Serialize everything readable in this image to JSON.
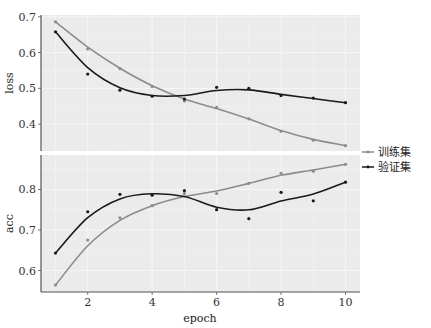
{
  "chart_data": [
    {
      "type": "line",
      "panel": "loss",
      "ylabel": "loss",
      "xlabel": "epoch",
      "x": [
        1,
        2,
        3,
        4,
        5,
        6,
        7,
        8,
        9,
        10
      ],
      "ylim": [
        0.325,
        0.705
      ],
      "yticks": [
        0.4,
        0.5,
        0.6,
        0.7
      ],
      "ytick_labels": [
        "0.4",
        "0.5",
        "0.6",
        "0.7"
      ],
      "series": [
        {
          "name": "训练集",
          "color": "#8c8c8c",
          "values": [
            0.686,
            0.61,
            0.555,
            0.505,
            0.465,
            0.447,
            0.415,
            0.38,
            0.355,
            0.34
          ]
        },
        {
          "name": "验证集",
          "color": "#1a1a1a",
          "values": [
            0.658,
            0.54,
            0.495,
            0.478,
            0.47,
            0.503,
            0.5,
            0.48,
            0.473,
            0.46
          ]
        }
      ],
      "smooth": true,
      "grid": true
    },
    {
      "type": "line",
      "panel": "acc",
      "ylabel": "acc",
      "xlabel": "epoch",
      "x": [
        1,
        2,
        3,
        4,
        5,
        6,
        7,
        8,
        9,
        10
      ],
      "ylim": [
        0.547,
        0.885
      ],
      "yticks": [
        0.6,
        0.7,
        0.8
      ],
      "ytick_labels": [
        "0.6",
        "0.7",
        "0.8"
      ],
      "series": [
        {
          "name": "训练集",
          "color": "#8c8c8c",
          "values": [
            0.564,
            0.675,
            0.73,
            0.76,
            0.79,
            0.79,
            0.815,
            0.84,
            0.845,
            0.862
          ]
        },
        {
          "name": "验证集",
          "color": "#1a1a1a",
          "values": [
            0.643,
            0.745,
            0.788,
            0.786,
            0.797,
            0.75,
            0.728,
            0.793,
            0.772,
            0.818
          ]
        }
      ],
      "smooth": true,
      "grid": true
    }
  ],
  "axes": {
    "xlabel": "epoch",
    "xticks": [
      2,
      4,
      6,
      8,
      10
    ],
    "xtick_labels": [
      "2",
      "4",
      "6",
      "8",
      "10"
    ],
    "xlim": [
      0.55,
      10.45
    ]
  },
  "legend": {
    "position": "right",
    "items": [
      {
        "label": "训练集",
        "color": "#8c8c8c"
      },
      {
        "label": "验证集",
        "color": "#1a1a1a"
      }
    ]
  },
  "style": {
    "panel_bg": "#ebebeb",
    "grid_color": "#f7f7f7",
    "axis_color": "#555555"
  }
}
